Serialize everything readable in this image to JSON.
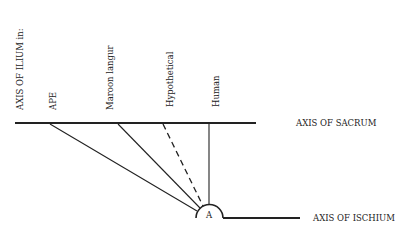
{
  "diagram": {
    "vertical_label": "AXIS OF ILIUM in:",
    "species": [
      {
        "name": "APE",
        "x": 50,
        "style": "solid"
      },
      {
        "name": "Maroon langur",
        "x": 118,
        "style": "solid"
      },
      {
        "name": "Hypothetical",
        "x": 163,
        "style": "dashed"
      },
      {
        "name": "Human",
        "x": 209,
        "style": "solid"
      }
    ],
    "sacrum_label": "AXIS OF SACRUM",
    "ischium_label": "AXIS OF ISCHIUM",
    "point_label": "A",
    "colors": {
      "line": "#222222",
      "background": "#ffffff"
    }
  }
}
